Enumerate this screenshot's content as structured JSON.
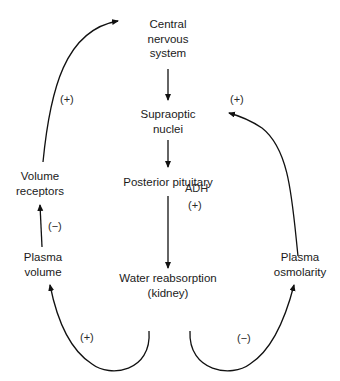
{
  "nodes": {
    "cns": {
      "line1": "Central",
      "line2": "nervous",
      "line3": "system"
    },
    "supraoptic": {
      "line1": "Supraoptic",
      "line2": "nuclei"
    },
    "posterior_pituitary": {
      "line1": "Posterior pituitary"
    },
    "water_reabsorption": {
      "line1": "Water reabsorption",
      "line2": "(kidney)"
    },
    "volume_receptors": {
      "line1": "Volume",
      "line2": "receptors"
    },
    "plasma_volume": {
      "line1": "Plasma",
      "line2": "volume"
    },
    "plasma_osmolarity": {
      "line1": "Plasma",
      "line2": "osmolarity"
    }
  },
  "edges": {
    "adh_label": "ADH",
    "adh_sign": "(+)",
    "receptors_to_cns_sign": "(+)",
    "plasma_volume_to_receptors_sign": "(−)",
    "water_to_plasma_volume_sign": "(+)",
    "water_to_osmolarity_sign": "(−)",
    "osmolarity_to_supraoptic_sign": "(+)"
  },
  "colors": {
    "line": "#111111",
    "text": "#1a1a1a",
    "background": "#ffffff"
  }
}
